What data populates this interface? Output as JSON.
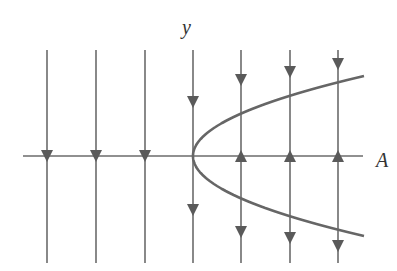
{
  "diagram": {
    "type": "phase-line bifurcation diagram",
    "labels": {
      "x_axis": "A",
      "y_axis": "y"
    },
    "colors": {
      "line": "#6b6b6b",
      "arrow": "#5a5a5a",
      "curve": "#666666"
    },
    "axis": {
      "horizontal": {
        "x1": 23,
        "x2": 363,
        "y": 156
      },
      "vertical_top": 50,
      "vertical_bottom": 263
    },
    "vertical_lines_x": [
      47,
      96,
      145,
      193,
      241,
      290,
      338
    ],
    "curve": {
      "shape": "parabola opening right",
      "vertex": [
        193,
        156
      ],
      "upper_end": [
        364,
        76
      ],
      "lower_end": [
        364,
        236
      ]
    },
    "arrows": [
      {
        "x": 47,
        "y": 156,
        "dir": "down"
      },
      {
        "x": 96,
        "y": 156,
        "dir": "down"
      },
      {
        "x": 145,
        "y": 156,
        "dir": "down"
      },
      {
        "x": 193,
        "y": 102,
        "dir": "down"
      },
      {
        "x": 193,
        "y": 210,
        "dir": "down"
      },
      {
        "x": 241,
        "y": 80,
        "dir": "down"
      },
      {
        "x": 241,
        "y": 156,
        "dir": "up"
      },
      {
        "x": 241,
        "y": 232,
        "dir": "down"
      },
      {
        "x": 290,
        "y": 72,
        "dir": "down"
      },
      {
        "x": 290,
        "y": 156,
        "dir": "up"
      },
      {
        "x": 290,
        "y": 238,
        "dir": "down"
      },
      {
        "x": 338,
        "y": 64,
        "dir": "down"
      },
      {
        "x": 338,
        "y": 156,
        "dir": "up"
      },
      {
        "x": 338,
        "y": 246,
        "dir": "down"
      }
    ]
  }
}
